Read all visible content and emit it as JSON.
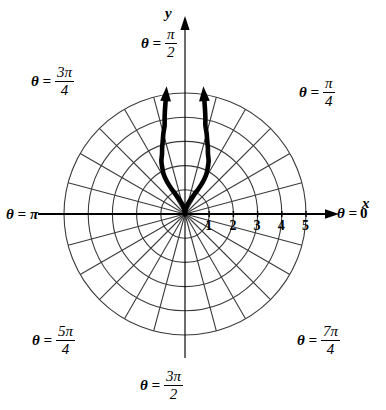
{
  "figure": {
    "background_color": "#ffffff",
    "ink_color": "#000000",
    "grid_color": "#3a3a3a"
  },
  "axes": {
    "x_letter": "x",
    "y_letter": "y",
    "x_tick_labels": [
      "1",
      "2",
      "3",
      "4",
      "5"
    ],
    "x_tick_values": [
      1,
      2,
      3,
      4,
      5
    ]
  },
  "angle_labels": [
    {
      "id": "theta-0",
      "eq": "θ =",
      "value": "0",
      "type": "plain",
      "degrees": 0
    },
    {
      "id": "theta-pi-4",
      "eq": "θ =",
      "num": "π",
      "den": "4",
      "type": "fraction",
      "degrees": 45
    },
    {
      "id": "theta-pi-2",
      "eq": "θ =",
      "num": "π",
      "den": "2",
      "type": "fraction",
      "degrees": 90
    },
    {
      "id": "theta-3pi-4",
      "eq": "θ =",
      "num": "3π",
      "den": "4",
      "type": "fraction",
      "degrees": 135
    },
    {
      "id": "theta-pi",
      "eq": "θ =",
      "value": "π",
      "type": "plain",
      "degrees": 180
    },
    {
      "id": "theta-5pi-4",
      "eq": "θ =",
      "num": "5π",
      "den": "4",
      "type": "fraction",
      "degrees": 225
    },
    {
      "id": "theta-3pi-2",
      "eq": "θ =",
      "num": "3π",
      "den": "2",
      "type": "fraction",
      "degrees": 270
    },
    {
      "id": "theta-7pi-4",
      "eq": "θ =",
      "num": "7π",
      "den": "4",
      "type": "fraction",
      "degrees": 315
    }
  ],
  "chart_data": {
    "type": "line",
    "coordinate_system": "polar",
    "title": "",
    "xlabel": "x",
    "ylabel": "y",
    "rlim": [
      0,
      5
    ],
    "r_gridlines": [
      1,
      2,
      3,
      4,
      5
    ],
    "theta_gridlines_deg": [
      0,
      15,
      30,
      45,
      60,
      75,
      90,
      105,
      120,
      135,
      150,
      165,
      180,
      195,
      210,
      225,
      240,
      255,
      270,
      285,
      300,
      315,
      330,
      345
    ],
    "grid": true,
    "legend": "none",
    "tick_labels": [
      "1",
      "2",
      "3",
      "4",
      "5"
    ],
    "series": [
      {
        "name": "r = θ (both branches, arrows indicate continuation)",
        "style": "thick-black",
        "arrowheads": "both-ends-upward",
        "branches": [
          {
            "name": "right branch",
            "points_polar_deg": [
              [
                0.0,
                90
              ],
              [
                0.18,
                82
              ],
              [
                0.36,
                76
              ],
              [
                0.55,
                71
              ],
              [
                0.74,
                67
              ],
              [
                0.95,
                64
              ],
              [
                1.16,
                62
              ],
              [
                1.4,
                61
              ],
              [
                1.65,
                61
              ],
              [
                1.9,
                62
              ],
              [
                2.15,
                64
              ],
              [
                2.4,
                66
              ],
              [
                2.65,
                69
              ],
              [
                2.9,
                71
              ],
              [
                3.15,
                73
              ],
              [
                3.45,
                75
              ],
              [
                3.75,
                77
              ],
              [
                4.05,
                78
              ],
              [
                4.35,
                79
              ],
              [
                4.65,
                80
              ],
              [
                5.0,
                81
              ]
            ]
          },
          {
            "name": "left branch",
            "points_polar_deg": [
              [
                0.0,
                90
              ],
              [
                0.18,
                98
              ],
              [
                0.36,
                104
              ],
              [
                0.55,
                109
              ],
              [
                0.74,
                113
              ],
              [
                0.95,
                116
              ],
              [
                1.16,
                118
              ],
              [
                1.4,
                119
              ],
              [
                1.65,
                119
              ],
              [
                1.9,
                118
              ],
              [
                2.15,
                116
              ],
              [
                2.4,
                114
              ],
              [
                2.65,
                111
              ],
              [
                2.9,
                109
              ],
              [
                3.15,
                107
              ],
              [
                3.45,
                105
              ],
              [
                3.75,
                103
              ],
              [
                4.05,
                102
              ],
              [
                4.35,
                101
              ],
              [
                4.65,
                100
              ],
              [
                5.0,
                99
              ]
            ]
          }
        ]
      }
    ]
  }
}
